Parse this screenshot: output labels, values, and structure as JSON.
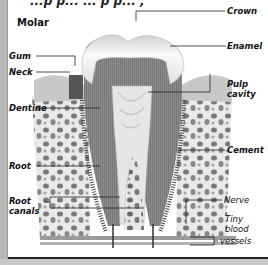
{
  "figure": {
    "top_cutoff_text": "...p p...  ... p p... ,",
    "title": "Molar",
    "labels_left": [
      {
        "id": "gum",
        "text": "Gum"
      },
      {
        "id": "neck",
        "text": "Neck"
      },
      {
        "id": "dentine",
        "text": "Dentine"
      },
      {
        "id": "root",
        "text": "Root"
      },
      {
        "id": "root_canals",
        "text": "Root canals",
        "line1": "Root",
        "line2": "canals"
      }
    ],
    "labels_right": [
      {
        "id": "crown",
        "text": "Crown"
      },
      {
        "id": "enamel",
        "text": "Enamel"
      },
      {
        "id": "pulp_cavity",
        "text": "Pulp cavity",
        "line1": "Pulp",
        "line2": "cavity"
      },
      {
        "id": "cement",
        "text": "Cement"
      },
      {
        "id": "nerve",
        "text": "Nerve"
      },
      {
        "id": "tiny_blood_vessels",
        "text": "Tiny blood vessels",
        "line1": "Tiny",
        "line2": "blood",
        "line3": "vessels"
      }
    ],
    "colors": {
      "panel": "#ffffff",
      "frame": "#c9c9c9",
      "dentine": "#8a8a8a",
      "enamel": "#eeeeee",
      "bone": "#d8d8d8",
      "leader": "#222222"
    }
  }
}
